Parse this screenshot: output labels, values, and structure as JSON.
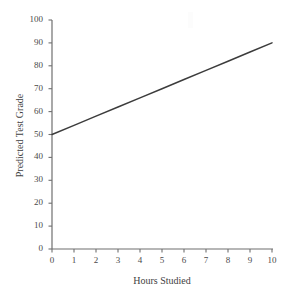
{
  "chart_data": {
    "type": "line",
    "title": "",
    "xlabel": "Hours Studied",
    "ylabel": "Predicted Test Grade",
    "xlim": [
      0,
      10
    ],
    "ylim": [
      0,
      100
    ],
    "xticks": [
      "0",
      "1",
      "2",
      "3",
      "4",
      "5",
      "6",
      "7",
      "8",
      "9",
      "10"
    ],
    "yticks": [
      "0",
      "10",
      "20",
      "30",
      "40",
      "50",
      "60",
      "70",
      "80",
      "90",
      "100"
    ],
    "grid": false,
    "legend": "none",
    "series": [
      {
        "name": "Predicted Test Grade",
        "color": "#3c3c3c",
        "x": [
          0,
          1,
          2,
          3,
          4,
          5,
          6,
          7,
          8,
          9,
          10
        ],
        "values": [
          50,
          54,
          58,
          62,
          66,
          70,
          74,
          78,
          82,
          86,
          90
        ]
      }
    ]
  },
  "colors": {
    "line": "#3c3c3c",
    "axis": "#6f6f6f",
    "text": "#3f3f3f",
    "background": "#ffffff"
  }
}
